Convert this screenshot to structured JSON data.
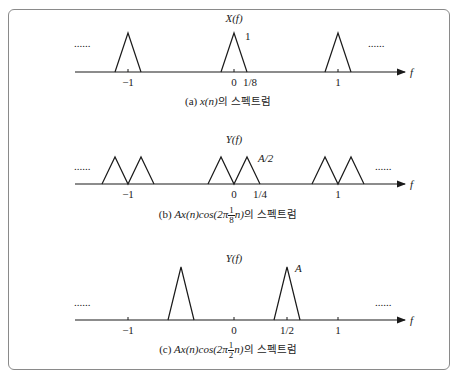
{
  "figure": {
    "panels": [
      {
        "id": "a",
        "title": "X(f)",
        "peak_label": "1",
        "ticks": [
          "−1",
          "0",
          "1/8",
          "1"
        ],
        "axis_label": "f",
        "ellipsis": "......",
        "caption": {
          "prefix": "(a) ",
          "expr": "x(n)",
          "suffix": "의 스펙트럼"
        }
      },
      {
        "id": "b",
        "title": "Y(f)",
        "peak_label": "A/2",
        "ticks": [
          "−1",
          "0",
          "1/4",
          "1"
        ],
        "axis_label": "f",
        "ellipsis": "......",
        "caption": {
          "prefix": "(b) ",
          "expr_a": "Ax(n)cos(2π",
          "frac_num": "1",
          "frac_den": "8",
          "expr_b": "n)",
          "suffix": "의 스펙트럼"
        }
      },
      {
        "id": "c",
        "title": "Y(f)",
        "peak_label": "A",
        "ticks": [
          "−1",
          "0",
          "1/2",
          "1"
        ],
        "axis_label": "f",
        "ellipsis": "......",
        "caption": {
          "prefix": "(c) ",
          "expr_a": "Ax(n)cos(2π",
          "frac_num": "1",
          "frac_den": "2",
          "expr_b": "n)",
          "suffix": "의 스펙트럼"
        }
      }
    ]
  },
  "colors": {
    "ink": "#1a1a1a",
    "frame": "#8a8a8a",
    "background": "#ffffff"
  }
}
